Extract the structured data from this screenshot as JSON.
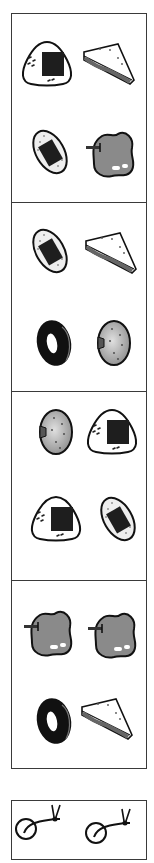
{
  "puzzle": {
    "panels": [
      {
        "id": 1,
        "items": [
          "onigiri-triangle",
          "sandwich",
          "onigiri-oval",
          "apple"
        ]
      },
      {
        "id": 2,
        "items": [
          "onigiri-oval",
          "sandwich",
          "donut",
          "bun"
        ]
      },
      {
        "id": 3,
        "items": [
          "bun",
          "onigiri-triangle",
          "onigiri-triangle",
          "onigiri-oval"
        ]
      },
      {
        "id": 4,
        "items": [
          "apple",
          "apple",
          "donut",
          "sandwich"
        ]
      },
      {
        "id": 5,
        "items": [
          "mouse",
          "mouse"
        ],
        "partially_visible": true
      }
    ],
    "colors": {
      "border": "#3a3a3a",
      "nori": "#1e1e1e",
      "apple": "#8a8a8a",
      "bun": "#bdbdbd",
      "donut": "#111111"
    }
  }
}
